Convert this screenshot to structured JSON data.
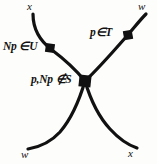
{
  "diagram": {
    "type": "crossing-curves-node-diagram",
    "background_color": "#fdfdfb",
    "stroke_color": "#111111",
    "corner_labels": {
      "top_left": "x",
      "top_right": "w",
      "bottom_left": "w",
      "bottom_right": "x"
    },
    "node_labels": {
      "left": "Np ∈U",
      "right": "p∈T",
      "center": "p,Np ∉S"
    },
    "nodes": [
      {
        "name": "left-node",
        "x": 50,
        "y": 48,
        "size": 9,
        "label": "Np ∈U"
      },
      {
        "name": "right-node",
        "x": 128,
        "y": 35,
        "size": 9,
        "label": "p∈T"
      },
      {
        "name": "center-node",
        "x": 85,
        "y": 81,
        "size": 12,
        "label": "p,Np ∉S"
      }
    ],
    "branches": [
      {
        "name": "upper-left-branch",
        "from": "x (top-left)",
        "to": "center-node"
      },
      {
        "name": "upper-right-branch",
        "from": "w (top-right)",
        "to": "center-node"
      },
      {
        "name": "lower-left-branch",
        "from": "w (bottom-left)",
        "to": "center-node"
      },
      {
        "name": "lower-right-branch",
        "from": "x (bottom-right)",
        "to": "center-node"
      }
    ]
  }
}
